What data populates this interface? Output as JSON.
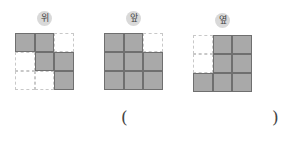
{
  "views": [
    {
      "label": "위",
      "left": 15,
      "top": 33,
      "badge_x": 37,
      "badge_y": 11,
      "cells": [
        [
          1,
          1,
          0
        ],
        [
          0,
          1,
          1
        ],
        [
          0,
          0,
          1
        ]
      ]
    },
    {
      "label": "앞",
      "left": 104,
      "top": 33,
      "badge_x": 126,
      "badge_y": 11,
      "cells": [
        [
          1,
          1,
          0
        ],
        [
          1,
          1,
          1
        ],
        [
          1,
          1,
          1
        ]
      ]
    },
    {
      "label": "옆",
      "left": 193,
      "top": 35,
      "badge_x": 215,
      "badge_y": 13,
      "cells": [
        [
          0,
          1,
          1
        ],
        [
          0,
          1,
          1
        ],
        [
          1,
          1,
          1
        ]
      ]
    }
  ],
  "answer": {
    "open": "(",
    "close": ")",
    "value": ""
  },
  "colors": {
    "filled": "#a9a9a9",
    "border": "#6f6f6f",
    "badge": "#d9d9d9"
  }
}
